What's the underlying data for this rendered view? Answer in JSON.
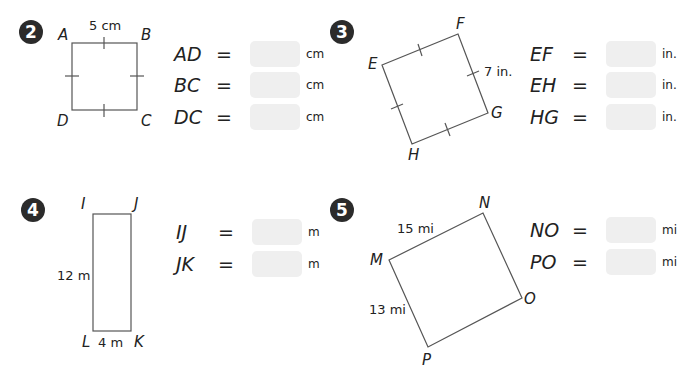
{
  "problems": [
    {
      "number": "2",
      "shape": "square",
      "vertices": {
        "A": "A",
        "B": "B",
        "C": "C",
        "D": "D"
      },
      "given_measure": "5 cm",
      "equations": [
        {
          "lhs": "AD",
          "eq": "=",
          "answer": "",
          "unit": "cm"
        },
        {
          "lhs": "BC",
          "eq": "=",
          "answer": "",
          "unit": "cm"
        },
        {
          "lhs": "DC",
          "eq": "=",
          "answer": "",
          "unit": "cm"
        }
      ]
    },
    {
      "number": "3",
      "shape": "square",
      "vertices": {
        "E": "E",
        "F": "F",
        "G": "G",
        "H": "H"
      },
      "given_measure": "7 in.",
      "equations": [
        {
          "lhs": "EF",
          "eq": "=",
          "answer": "",
          "unit": "in."
        },
        {
          "lhs": "EH",
          "eq": "=",
          "answer": "",
          "unit": "in."
        },
        {
          "lhs": "HG",
          "eq": "=",
          "answer": "",
          "unit": "in."
        }
      ]
    },
    {
      "number": "4",
      "shape": "rectangle",
      "vertices": {
        "I": "I",
        "J": "J",
        "K": "K",
        "L": "L"
      },
      "side_measure": "12 m",
      "bottom_measure": "4 m",
      "equations": [
        {
          "lhs": "IJ",
          "eq": "=",
          "answer": "",
          "unit": "m"
        },
        {
          "lhs": "JK",
          "eq": "=",
          "answer": "",
          "unit": "m"
        }
      ]
    },
    {
      "number": "5",
      "shape": "rectangle",
      "vertices": {
        "M": "M",
        "N": "N",
        "O": "O",
        "P": "P"
      },
      "top_measure": "15 mi",
      "side_measure": "13 mi",
      "equations": [
        {
          "lhs": "NO",
          "eq": "=",
          "answer": "",
          "unit": "mi"
        },
        {
          "lhs": "PO",
          "eq": "=",
          "answer": "",
          "unit": "mi"
        }
      ]
    }
  ],
  "colors": {
    "badge": "#2b2b2b",
    "answer_box": "#efefef",
    "line": "#555555"
  }
}
